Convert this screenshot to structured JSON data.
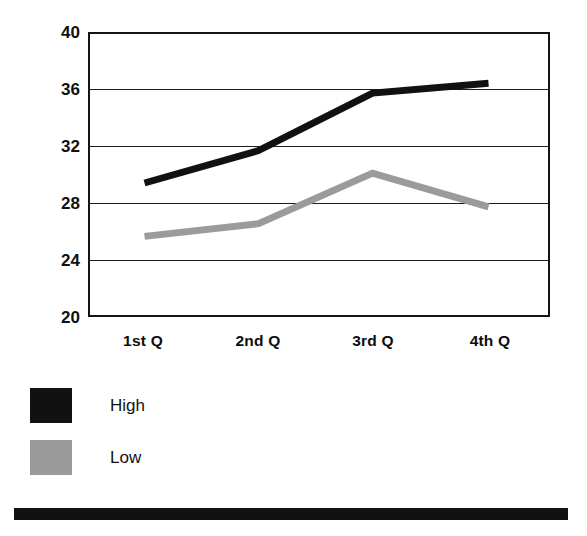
{
  "chart_data": {
    "type": "line",
    "title": "",
    "subtitle": "",
    "xlabel": "",
    "ylabel": "",
    "categories": [
      "1st Q",
      "2nd Q",
      "3rd Q",
      "4th Q"
    ],
    "series": [
      {
        "name": "High",
        "color": "#111111",
        "values": [
          29.4,
          31.7,
          35.8,
          36.5
        ]
      },
      {
        "name": "Low",
        "color": "#9b9b9b",
        "values": [
          25.6,
          26.5,
          30.1,
          27.7
        ]
      }
    ],
    "ylim": [
      20,
      40
    ],
    "yticks": [
      40,
      36,
      32,
      28,
      24,
      20
    ],
    "grid": true,
    "legend_position": "below-left",
    "legend_entries": [
      {
        "label": "High",
        "color": "#111111"
      },
      {
        "label": "Low",
        "color": "#9b9b9b"
      }
    ]
  },
  "axis": {
    "y_tick_labels": [
      "40",
      "36",
      "32",
      "28",
      "24",
      "20"
    ]
  },
  "footer": {
    "bar_color": "#111111"
  }
}
